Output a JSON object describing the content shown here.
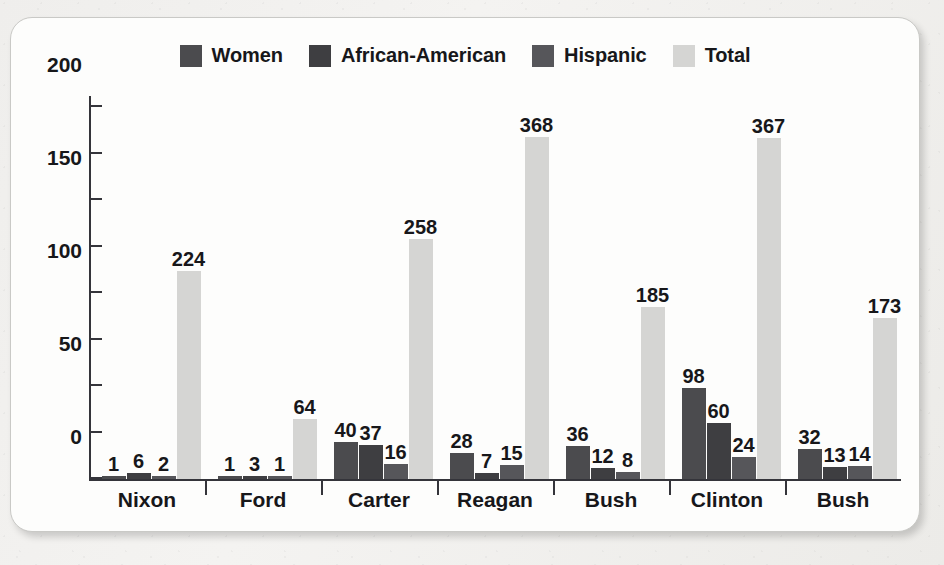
{
  "chart_data": {
    "type": "bar",
    "title": "",
    "subtitle": "",
    "xlabel": "",
    "ylabel": "",
    "ylim": [
      0,
      400
    ],
    "ytick_values": [
      0,
      50,
      100,
      150,
      200,
      250,
      300,
      350,
      400
    ],
    "ytick_labels": [
      "0",
      "50",
      "100",
      "150",
      "200",
      "250",
      "300",
      "350",
      "400"
    ],
    "grid": false,
    "legend_position": "top-center",
    "categories": [
      "Nixon",
      "Ford",
      "Carter",
      "Reagan",
      "Bush",
      "Clinton",
      "Bush"
    ],
    "series": [
      {
        "name": "Women",
        "color": "#4b4b4e",
        "values": [
          1,
          1,
          40,
          28,
          36,
          98,
          32
        ]
      },
      {
        "name": "African-American",
        "color": "#3e3e41",
        "values": [
          6,
          3,
          37,
          7,
          12,
          60,
          13
        ]
      },
      {
        "name": "Hispanic",
        "color": "#56565a",
        "values": [
          2,
          1,
          16,
          15,
          8,
          24,
          14
        ]
      },
      {
        "name": "Total",
        "color": "#d5d5d3",
        "values": [
          224,
          64,
          258,
          368,
          185,
          367,
          173
        ]
      }
    ]
  },
  "legend": {
    "items": [
      {
        "label": "Women",
        "swatch": "#4b4b4e"
      },
      {
        "label": "African-American",
        "swatch": "#3e3e41"
      },
      {
        "label": "Hispanic",
        "swatch": "#56565a"
      },
      {
        "label": "Total",
        "swatch": "#d5d5d3"
      }
    ]
  },
  "colors": {
    "card_background": "#fdfdfc",
    "page_background": "#f2f2f0",
    "axis": "#34343a",
    "text": "#17171a"
  }
}
